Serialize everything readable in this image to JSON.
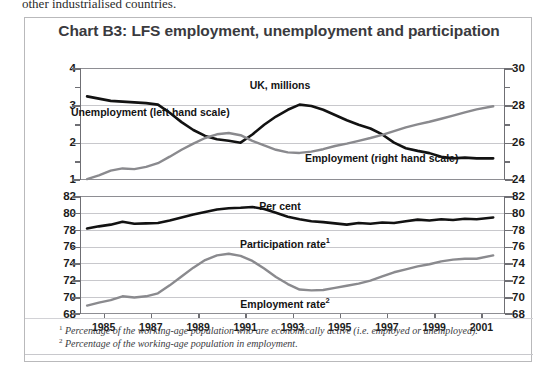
{
  "page": {
    "running_text": "other industrialised countries."
  },
  "chart": {
    "title": "Chart B3: LFS employment, unemployment and participation",
    "footnotes": [
      "Percentage of the working-age population who are economically active (i.e. employed or unemployed).",
      "Percentage of the working-age population in employment."
    ],
    "footnote_markers": [
      "1",
      "2"
    ]
  },
  "chart_data": [
    {
      "type": "line",
      "id": "upper",
      "title": "UK, millions",
      "xlabel": "",
      "ylabel": "UK, millions",
      "xlim": [
        1984.0,
        2002.0
      ],
      "xticks": [
        1985,
        1987,
        1989,
        1991,
        1993,
        1995,
        1997,
        1999,
        2001
      ],
      "xticklabels": [
        "1985",
        "1987",
        "1989",
        "1991",
        "1993",
        "1995",
        "1997",
        "1999",
        "2001"
      ],
      "grid": true,
      "legend": "inline-annotation",
      "axes": [
        {
          "side": "left",
          "label": "Unemployment (left hand scale)",
          "ylim": [
            1,
            4
          ],
          "yticks": [
            1,
            2,
            3,
            4
          ],
          "yticklabels": [
            "1",
            "2",
            "3",
            "4"
          ],
          "minor_yticks": [
            1.5,
            2.5,
            3.5
          ]
        },
        {
          "side": "right",
          "label": "Employment (right hand scale)",
          "ylim": [
            24,
            30
          ],
          "yticks": [
            24,
            26,
            28,
            30
          ],
          "yticklabels": [
            "24",
            "26",
            "28",
            "30"
          ],
          "minor_yticks": [
            25,
            27,
            29
          ]
        }
      ],
      "series": [
        {
          "name": "Unemployment (left hand scale)",
          "axis": "left",
          "units": "millions",
          "color": "#121212",
          "x": [
            1984.3,
            1984.8,
            1985.3,
            1985.8,
            1986.3,
            1986.8,
            1987.3,
            1987.8,
            1988.3,
            1988.8,
            1989.3,
            1989.8,
            1990.3,
            1990.8,
            1991.3,
            1991.8,
            1992.3,
            1992.8,
            1993.3,
            1993.8,
            1994.3,
            1994.8,
            1995.3,
            1995.8,
            1996.3,
            1996.8,
            1997.3,
            1997.8,
            1998.3,
            1998.8,
            1999.3,
            1999.8,
            2000.3,
            2000.8,
            2001.5
          ],
          "y": [
            3.24,
            3.18,
            3.12,
            3.1,
            3.08,
            3.06,
            3.02,
            2.8,
            2.55,
            2.34,
            2.18,
            2.09,
            2.05,
            2.0,
            2.22,
            2.48,
            2.7,
            2.88,
            3.02,
            2.98,
            2.88,
            2.74,
            2.6,
            2.48,
            2.38,
            2.22,
            2.0,
            1.85,
            1.78,
            1.72,
            1.62,
            1.58,
            1.6,
            1.58,
            1.58
          ]
        },
        {
          "name": "Employment (right hand scale)",
          "axis": "right",
          "units": "millions",
          "color": "#8a8a8e",
          "x": [
            1984.3,
            1984.8,
            1985.3,
            1985.8,
            1986.3,
            1986.8,
            1987.3,
            1987.8,
            1988.3,
            1988.8,
            1989.3,
            1989.8,
            1990.3,
            1990.8,
            1991.3,
            1991.8,
            1992.3,
            1992.8,
            1993.3,
            1993.8,
            1994.3,
            1994.8,
            1995.3,
            1995.8,
            1996.3,
            1996.8,
            1997.3,
            1997.8,
            1998.3,
            1998.8,
            1999.3,
            1999.8,
            2000.3,
            2000.8,
            2001.5
          ],
          "y": [
            24.05,
            24.25,
            24.5,
            24.62,
            24.58,
            24.7,
            24.9,
            25.25,
            25.62,
            25.95,
            26.25,
            26.45,
            26.52,
            26.4,
            26.1,
            25.85,
            25.62,
            25.48,
            25.45,
            25.52,
            25.65,
            25.82,
            25.95,
            26.1,
            26.25,
            26.42,
            26.62,
            26.82,
            26.98,
            27.12,
            27.28,
            27.45,
            27.62,
            27.78,
            27.95
          ]
        }
      ]
    },
    {
      "type": "line",
      "id": "lower",
      "title": "Per cent",
      "xlabel": "",
      "ylabel": "Per cent",
      "xlim": [
        1984.0,
        2002.0
      ],
      "xticks": [
        1985,
        1987,
        1989,
        1991,
        1993,
        1995,
        1997,
        1999,
        2001
      ],
      "xticklabels": [
        "1985",
        "1987",
        "1989",
        "1991",
        "1993",
        "1995",
        "1997",
        "1999",
        "2001"
      ],
      "ylim": [
        68,
        82
      ],
      "yticks": [
        68,
        70,
        72,
        74,
        76,
        78,
        80,
        82
      ],
      "yticklabels": [
        "68",
        "70",
        "72",
        "74",
        "76",
        "78",
        "80",
        "82"
      ],
      "grid": true,
      "legend": "inline-annotation",
      "series": [
        {
          "name": "Participation rate",
          "footnote": "1",
          "units": "per cent",
          "color": "#121212",
          "x": [
            1984.3,
            1984.8,
            1985.3,
            1985.8,
            1986.3,
            1986.8,
            1987.3,
            1987.8,
            1988.3,
            1988.8,
            1989.3,
            1989.8,
            1990.3,
            1990.8,
            1991.3,
            1991.8,
            1992.3,
            1992.8,
            1993.3,
            1993.8,
            1994.3,
            1994.8,
            1995.3,
            1995.8,
            1996.3,
            1996.8,
            1997.3,
            1997.8,
            1998.3,
            1998.8,
            1999.3,
            1999.8,
            2000.3,
            2000.8,
            2001.5
          ],
          "y": [
            78.15,
            78.4,
            78.6,
            78.95,
            78.7,
            78.75,
            78.8,
            79.1,
            79.45,
            79.8,
            80.1,
            80.4,
            80.55,
            80.6,
            80.7,
            80.45,
            80.0,
            79.55,
            79.25,
            79.0,
            78.9,
            78.75,
            78.6,
            78.8,
            78.7,
            78.85,
            78.8,
            79.0,
            79.2,
            79.1,
            79.25,
            79.15,
            79.3,
            79.25,
            79.45
          ]
        },
        {
          "name": "Employment rate",
          "footnote": "2",
          "units": "per cent",
          "color": "#8a8a8e",
          "x": [
            1984.3,
            1984.8,
            1985.3,
            1985.8,
            1986.3,
            1986.8,
            1987.3,
            1987.8,
            1988.3,
            1988.8,
            1989.3,
            1989.8,
            1990.3,
            1990.8,
            1991.3,
            1991.8,
            1992.3,
            1992.8,
            1993.3,
            1993.8,
            1994.3,
            1994.8,
            1995.3,
            1995.8,
            1996.3,
            1996.8,
            1997.3,
            1997.8,
            1998.3,
            1998.8,
            1999.3,
            1999.8,
            2000.3,
            2000.8,
            2001.5
          ],
          "y": [
            69.0,
            69.35,
            69.65,
            70.1,
            69.95,
            70.1,
            70.45,
            71.4,
            72.45,
            73.5,
            74.4,
            74.95,
            75.15,
            74.9,
            74.3,
            73.4,
            72.4,
            71.55,
            70.9,
            70.8,
            70.85,
            71.1,
            71.35,
            71.6,
            71.95,
            72.45,
            72.95,
            73.3,
            73.65,
            73.9,
            74.25,
            74.45,
            74.55,
            74.55,
            74.95
          ]
        }
      ],
      "annotations": [
        {
          "text": "Per cent",
          "x": 1993.2,
          "y": 81.4
        },
        {
          "text": "Participation rate",
          "sup": "1",
          "x": 1992.0,
          "y": 77.3
        },
        {
          "text": "Employment rate",
          "sup": "2",
          "x": 1992.0,
          "y": 68.9
        }
      ]
    }
  ]
}
